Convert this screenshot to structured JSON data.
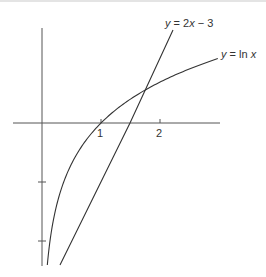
{
  "figure": {
    "colors": {
      "axis": "#555555",
      "curve": "#333333",
      "background": "#ffffff"
    },
    "x_ticks": [
      {
        "value": 1,
        "label": "1"
      },
      {
        "value": 2,
        "label": "2"
      }
    ],
    "y_ticks": [
      {
        "value": -1,
        "label": ""
      },
      {
        "value": -2,
        "label": ""
      }
    ],
    "curves": [
      {
        "name": "ln",
        "label_var": "y",
        "label_eq": " = ln ",
        "label_arg": "x",
        "full_label": "y = ln x"
      },
      {
        "name": "line",
        "label_var": "y",
        "label_eq": " = 2",
        "label_arg": "x",
        "label_tail": " − 3",
        "full_label": "y = 2x − 3"
      }
    ]
  },
  "chart_data": {
    "type": "line",
    "title": "",
    "xlabel": "",
    "ylabel": "",
    "x_ticks": [
      1,
      2
    ],
    "y_ticks": [
      -1,
      -2
    ],
    "series": [
      {
        "name": "y = ln x",
        "function": "ln(x)",
        "x_range": [
          0.09,
          2.98
        ]
      },
      {
        "name": "y = 2x − 3",
        "function": "2x-3",
        "x_range": [
          0.29,
          2.23
        ]
      }
    ],
    "intersections": [
      {
        "x": 1.76,
        "y": 0.57
      }
    ],
    "xlim": [
      -0.5,
      3.0
    ],
    "ylim": [
      -2.4,
      1.6
    ],
    "grid": false,
    "legend": "inline labels"
  }
}
